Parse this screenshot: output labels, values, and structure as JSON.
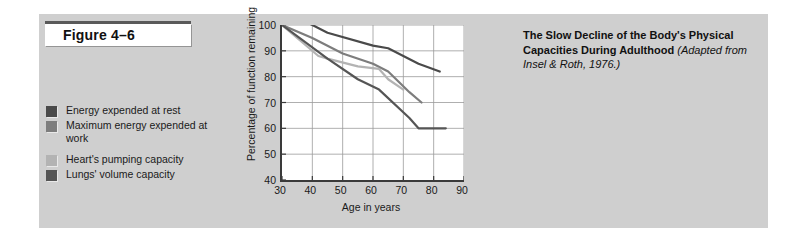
{
  "figure": {
    "number_label": "Figure 4–6",
    "panel_color": "#cfcfcf"
  },
  "caption": {
    "title": "The Slow Decline of the Body's Physical Capacities During Adulthood",
    "source": "(Adapted from Insel & Roth, 1976.)"
  },
  "legend": {
    "items": [
      {
        "label": "Energy expended at rest",
        "color": "#4a4a4a"
      },
      {
        "label": "Maximum energy expended at work",
        "color": "#7d7d7d"
      },
      {
        "label": "Heart's pumping capacity",
        "color": "#b3b3b3"
      },
      {
        "label": "Lungs' volume capacity",
        "color": "#555555"
      }
    ]
  },
  "chart_data": {
    "type": "line",
    "title": "The Slow Decline of the Body's Physical Capacities During Adulthood",
    "xlabel": "Age in years",
    "ylabel": "Percentage of function remaining",
    "xlim": [
      30,
      90
    ],
    "ylim": [
      40,
      100
    ],
    "xticks": [
      30,
      40,
      50,
      60,
      70,
      80,
      90
    ],
    "yticks": [
      40,
      50,
      60,
      70,
      80,
      90,
      100
    ],
    "grid": true,
    "legend_position": "left-panel",
    "series": [
      {
        "name": "Energy expended at rest",
        "color": "#4a4a4a",
        "x": [
          30,
          35,
          45,
          60,
          65,
          75,
          82
        ],
        "y": [
          100,
          103,
          97,
          92,
          91,
          85,
          82
        ]
      },
      {
        "name": "Maximum energy expended at work",
        "color": "#7d7d7d",
        "x": [
          30,
          40,
          50,
          60,
          65,
          72,
          76
        ],
        "y": [
          100,
          95,
          89,
          85,
          82,
          74,
          70
        ]
      },
      {
        "name": "Heart's pumping capacity",
        "color": "#b3b3b3",
        "x": [
          30,
          42,
          45,
          55,
          62,
          65,
          70
        ],
        "y": [
          100,
          88,
          87,
          84,
          83,
          79,
          75
        ]
      },
      {
        "name": "Lungs' volume capacity",
        "color": "#555555",
        "x": [
          30,
          45,
          55,
          62,
          72,
          75,
          84
        ],
        "y": [
          100,
          87,
          79,
          75,
          64,
          60,
          60
        ]
      }
    ]
  }
}
